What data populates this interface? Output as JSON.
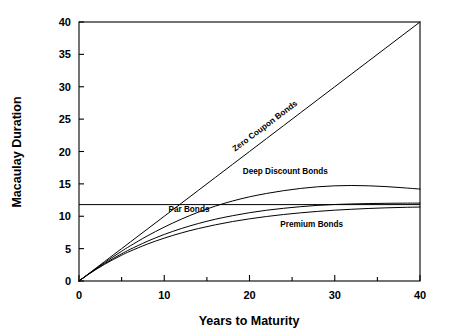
{
  "chart_data": {
    "type": "line",
    "title": "",
    "xlabel": "Years to Maturity",
    "ylabel": "Macaulay Duration",
    "xlim": [
      0,
      40
    ],
    "ylim": [
      0,
      40
    ],
    "grid": false,
    "legend_position": "inline-labels",
    "x_major_ticks": [
      0,
      10,
      20,
      30,
      40
    ],
    "x_major_tick_labels": [
      "0",
      "10",
      "20",
      "30",
      "40"
    ],
    "x_minor_ticks": [
      5,
      15,
      25,
      35
    ],
    "y_ticks": [
      0,
      5,
      10,
      15,
      20,
      25,
      30,
      35,
      40
    ],
    "y_tick_labels": [
      "0",
      "5",
      "10",
      "15",
      "20",
      "25",
      "30",
      "35",
      "40"
    ],
    "x": [
      0,
      1,
      2,
      3,
      4,
      5,
      6,
      8,
      10,
      12,
      14,
      16,
      18,
      20,
      22,
      24,
      26,
      28,
      30,
      32,
      34,
      36,
      38,
      40
    ],
    "series": [
      {
        "name": "Zero Coupon Bonds",
        "label": "Zero Coupon Bonds",
        "label_rotated": true,
        "values": [
          0,
          1,
          2,
          3,
          4,
          5,
          6,
          8,
          10,
          12,
          14,
          16,
          18,
          20,
          22,
          24,
          26,
          28,
          30,
          32,
          34,
          36,
          38,
          40
        ]
      },
      {
        "name": "Deep Discount Bonds",
        "label": "Deep Discount Bonds",
        "label_rotated": false,
        "values": [
          0,
          0.97,
          1.92,
          2.84,
          3.73,
          4.6,
          5.42,
          6.95,
          8.32,
          9.55,
          10.63,
          11.57,
          12.35,
          13.0,
          13.52,
          13.95,
          14.3,
          14.55,
          14.7,
          14.75,
          14.7,
          14.58,
          14.4,
          14.2
        ]
      },
      {
        "name": "Par Bonds",
        "label": "Par Bonds",
        "label_rotated": false,
        "values": [
          0,
          0.95,
          1.84,
          2.68,
          3.47,
          4.2,
          4.89,
          6.12,
          7.19,
          8.1,
          8.88,
          9.54,
          10.08,
          10.55,
          10.93,
          11.23,
          11.48,
          11.68,
          11.82,
          11.9,
          11.96,
          12.0,
          12.02,
          12.03
        ]
      },
      {
        "name": "Premium Bonds",
        "label": "Premium Bonds",
        "label_rotated": false,
        "values": [
          0,
          0.93,
          1.79,
          2.58,
          3.31,
          3.98,
          4.6,
          5.69,
          6.62,
          7.42,
          8.1,
          8.68,
          9.18,
          9.6,
          9.96,
          10.27,
          10.53,
          10.75,
          10.94,
          11.08,
          11.2,
          11.3,
          11.37,
          11.42
        ]
      }
    ],
    "reference_line": {
      "name": "duration-reference-line",
      "orientation": "horizontal",
      "value": 11.8
    },
    "annotations": [
      {
        "name": "zero-coupon-label",
        "text": "Zero Coupon Bonds",
        "x": 22.0,
        "y": 23.6,
        "rotation": -37
      },
      {
        "name": "deep-discount-label",
        "text": "Deep Discount Bonds",
        "x": 24.2,
        "y": 16.6,
        "rotation": 0
      },
      {
        "name": "par-bonds-label",
        "text": "Par Bonds",
        "x": 12.9,
        "y": 10.6,
        "rotation": 0
      },
      {
        "name": "premium-bonds-label",
        "text": "Premium Bonds",
        "x": 27.3,
        "y": 8.4,
        "rotation": 0
      }
    ],
    "colors": {
      "background": "#ffffff",
      "axis": "#000000",
      "curve": "#000000",
      "text": "#000000"
    }
  }
}
